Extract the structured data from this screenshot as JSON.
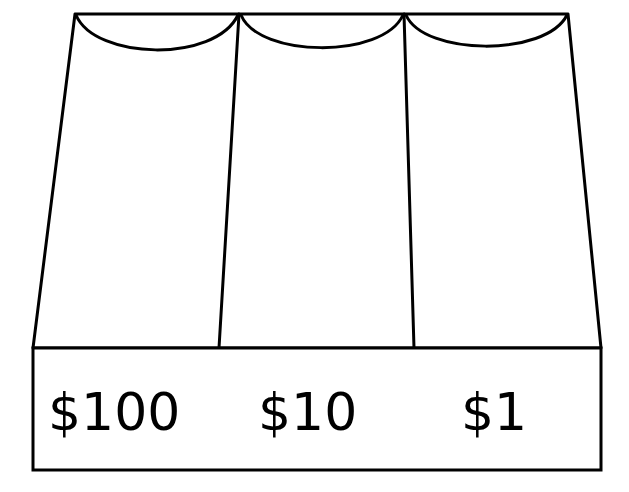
{
  "diagram": {
    "background_color": "#ffffff",
    "stroke_color": "#000000",
    "fill_color": "#ffffff",
    "curtains": [
      {
        "name": "left-curtain",
        "label": "$100"
      },
      {
        "name": "center-curtain",
        "label": "$10"
      },
      {
        "name": "right-curtain",
        "label": "$1"
      }
    ],
    "sign_bar": {
      "name": "value-sign-bar",
      "labels": [
        "$100",
        "$10",
        "$1"
      ]
    }
  }
}
